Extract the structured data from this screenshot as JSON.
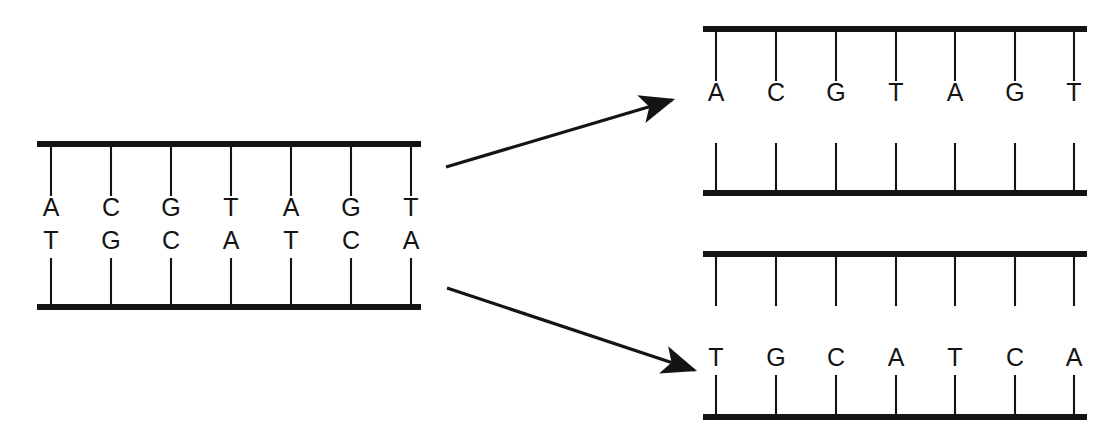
{
  "figure": {
    "background_color": "#ffffff",
    "ink_color": "#141414"
  },
  "chart_data": {
    "type": "diagram",
    "panels": [
      {
        "id": "parent-duplex",
        "role": "parent",
        "position": "left",
        "top_strand_bases": [
          "A",
          "C",
          "G",
          "T",
          "A",
          "G",
          "T"
        ],
        "bottom_strand_bases": [
          "T",
          "G",
          "C",
          "A",
          "T",
          "C",
          "A"
        ],
        "top_strand_filled": true,
        "bottom_strand_filled": true,
        "base_count": 7
      },
      {
        "id": "daughter-duplex-top",
        "role": "daughter",
        "position": "top-right",
        "top_strand_bases": [
          "A",
          "C",
          "G",
          "T",
          "A",
          "G",
          "T"
        ],
        "bottom_strand_bases": [
          "",
          "",
          "",
          "",
          "",
          "",
          ""
        ],
        "top_strand_filled": true,
        "bottom_strand_filled": false,
        "base_count": 7
      },
      {
        "id": "daughter-duplex-bottom",
        "role": "daughter",
        "position": "bottom-right",
        "top_strand_bases": [
          "",
          "",
          "",
          "",
          "",
          "",
          ""
        ],
        "bottom_strand_bases": [
          "T",
          "G",
          "C",
          "A",
          "T",
          "C",
          "A"
        ],
        "top_strand_filled": false,
        "bottom_strand_filled": true,
        "base_count": 7
      }
    ],
    "arrows": [
      {
        "id": "arrow-to-top-daughter",
        "from": "parent-duplex",
        "to": "daughter-duplex-top",
        "direction": "up-right",
        "x1": 446,
        "y1": 167,
        "x2": 672,
        "y2": 100
      },
      {
        "id": "arrow-to-bottom-daughter",
        "from": "parent-duplex",
        "to": "daughter-duplex-bottom",
        "direction": "down-right",
        "x1": 447,
        "y1": 288,
        "x2": 694,
        "y2": 370
      }
    ],
    "legend": [],
    "annotations": []
  },
  "geometry": {
    "parent": {
      "backbone_x_start": 37,
      "backbone_x_end": 421,
      "top_backbone_y": 144,
      "bottom_backbone_y": 307,
      "tick_x": [
        51,
        111,
        171,
        231,
        291,
        351,
        411
      ],
      "top_tick_y_end": 196,
      "top_letter_y": 216,
      "bottom_letter_y": 249,
      "bottom_tick_y_start": 258
    },
    "daughter_top": {
      "backbone_x_start": 703,
      "backbone_x_end": 1087,
      "top_backbone_y": 29,
      "bottom_backbone_y": 193,
      "tick_x": [
        716,
        776,
        836,
        896,
        955,
        1015,
        1074
      ],
      "top_tick_y_end": 81,
      "top_letter_y": 101,
      "bottom_tick_y_start": 143
    },
    "daughter_bottom": {
      "backbone_x_start": 703,
      "backbone_x_end": 1087,
      "top_backbone_y": 254,
      "bottom_backbone_y": 417,
      "tick_x": [
        716,
        776,
        836,
        896,
        955,
        1015,
        1074
      ],
      "top_tick_y_end": 306,
      "bottom_letter_y": 366,
      "bottom_tick_y_start": 375
    }
  }
}
